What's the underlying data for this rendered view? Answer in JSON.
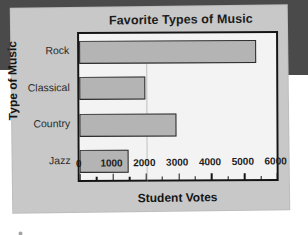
{
  "page": {
    "background": "#ffffff",
    "card_color": "#c8c8c8",
    "scan_band_color": "#4a4a4a"
  },
  "chart_data": {
    "type": "bar",
    "orientation": "horizontal",
    "title": "Favorite Types of Music",
    "xlabel": "Student Votes",
    "ylabel": "Type of Music",
    "categories": [
      "Rock",
      "Classical",
      "Country",
      "Jazz"
    ],
    "values": [
      5400,
      2000,
      2950,
      1500
    ],
    "xlim": [
      0,
      6000
    ],
    "xticks": [
      0,
      1000,
      2000,
      3000,
      4000,
      5000,
      6000
    ],
    "xtick_labels": [
      "0",
      "1000",
      "2000",
      "3000",
      "4000",
      "5000",
      "6000"
    ],
    "minor_tick_interval": 500,
    "grid": false,
    "legend": false,
    "bar_fill_color": "#b4b4b4",
    "bar_edge_color": "#2a2a2a",
    "plot_background": "#f3f3f3",
    "plot_border_color": "#141414"
  }
}
